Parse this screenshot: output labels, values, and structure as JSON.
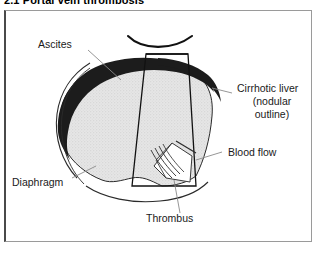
{
  "section": {
    "heading": "2.1 Portal vein thrombosis"
  },
  "figure": {
    "name": "portal-vein-thrombosis-ultrasound-diagram",
    "labels": {
      "ascites": "Ascites",
      "cirrhotic_liver_line1": "Cirrhotic liver",
      "cirrhotic_liver_line2": "(nodular",
      "cirrhotic_liver_line3": "outline)",
      "blood_flow": "Blood flow",
      "diaphragm": "Diaphragm",
      "thrombus": "Thrombus"
    },
    "colors": {
      "ascites_fill": "#1c1c1c",
      "liver_fill": "#e3e3e3",
      "liver_stipple": "#b8b8b8",
      "outline": "#1a1a1a",
      "leader_line": "#777777",
      "frame_border": "#9a9a9a",
      "frame_border_left": "#4a4a4a",
      "background": "#ffffff",
      "text": "#1a1a1a"
    }
  }
}
